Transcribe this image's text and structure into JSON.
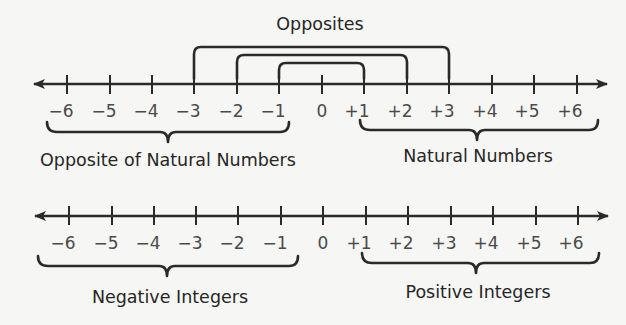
{
  "diagram": {
    "title": "Opposites",
    "colors": {
      "ink": "#2a2a2a",
      "number_text": "#4a4a4a",
      "label_text": "#262626",
      "background": "#f6f6f4"
    },
    "number_line_1": {
      "ticks": [
        "−6",
        "−5",
        "−4",
        "−3",
        "−2",
        "−1",
        "0",
        "+1",
        "+2",
        "+3",
        "+4",
        "+5",
        "+6"
      ],
      "opposite_pairs": [
        [
          "−3",
          "+3"
        ],
        [
          "−2",
          "+2"
        ],
        [
          "−1",
          "+1"
        ]
      ],
      "left_group_label": "Opposite of Natural Numbers",
      "right_group_label": "Natural Numbers"
    },
    "number_line_2": {
      "ticks": [
        "−6",
        "−5",
        "−4",
        "−3",
        "−2",
        "−1",
        "0",
        "+1",
        "+2",
        "+3",
        "+4",
        "+5",
        "+6"
      ],
      "left_group_label": "Negative Integers",
      "right_group_label": "Positive Integers"
    }
  }
}
